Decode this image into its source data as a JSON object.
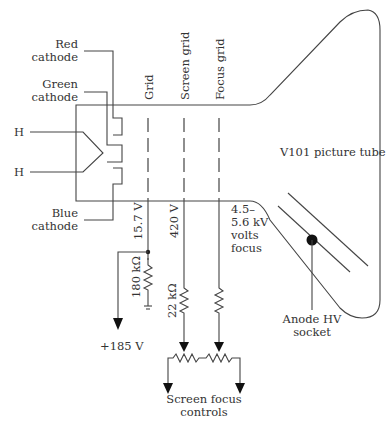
{
  "diagram": {
    "title": "V101 picture tube",
    "labels": {
      "red_cathode": [
        "Red",
        "cathode"
      ],
      "green_cathode": [
        "Green",
        "cathode"
      ],
      "blue_cathode": [
        "Blue",
        "cathode"
      ],
      "heater_1": "H",
      "heater_2": "H",
      "grid": "Grid",
      "screen_grid": "Screen grid",
      "focus_grid": "Focus grid",
      "grid_voltage": "15.7 V",
      "screen_voltage": "420 V",
      "focus_voltage": [
        "4.5–",
        "5.6 kV",
        "volts",
        "focus"
      ],
      "r_grid": "180 kΩ",
      "r_screen": "22 kΩ",
      "supply": "+185 V",
      "controls": [
        "Screen focus",
        "controls"
      ],
      "anode": [
        "Anode HV",
        "socket"
      ]
    }
  }
}
